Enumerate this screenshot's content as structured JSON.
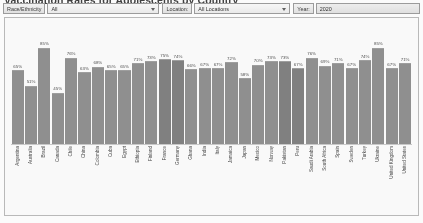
{
  "header": {
    "title": "Vaccination Rates for Adolescents by Country"
  },
  "filters": {
    "race": {
      "label": "Race/Ethnicity",
      "value": "All"
    },
    "location": {
      "label": "Location:",
      "value": "All Locations"
    },
    "year": {
      "label": "Year:",
      "value": "2020"
    },
    "chevron_icon": "chevron-down-icon"
  },
  "chart_data": {
    "type": "bar",
    "title": "Vaccination Rates for Adolescents by Country",
    "xlabel": "",
    "ylabel": "",
    "ylim": [
      0,
      100
    ],
    "grid": false,
    "legend": "none",
    "value_suffix": "%",
    "categories": [
      "Argentina",
      "Australia",
      "Brazil",
      "Canada",
      "Chile",
      "China",
      "Colombia",
      "Cuba",
      "Egypt",
      "Ethiopia",
      "Finland",
      "France",
      "Germany",
      "Ghana",
      "India",
      "Italy",
      "Jamaica",
      "Japan",
      "Mexico",
      "Norway",
      "Pakistan",
      "Peru",
      "Saudi Arabia",
      "South Africa",
      "Spain",
      "Sweden",
      "Turkey",
      "Ukraine",
      "United Kingdom",
      "United States"
    ],
    "values": [
      65,
      51,
      85,
      45,
      76,
      63,
      68,
      65,
      65,
      71,
      73,
      75,
      74,
      66,
      67,
      67,
      72,
      58,
      70,
      73,
      73,
      67,
      76,
      69,
      71,
      67,
      74,
      85,
      67,
      71
    ],
    "labels": [
      "65%",
      "51%",
      "85%",
      "45%",
      "76%",
      "63%",
      "68%",
      "65%",
      "65%",
      "71%",
      "73%",
      "75%",
      "74%",
      "66%",
      "67%",
      "67%",
      "72%",
      "58%",
      "70%",
      "73%",
      "73%",
      "67%",
      "76%",
      "69%",
      "71%",
      "67%",
      "74%",
      "85%",
      "67%",
      "71%"
    ],
    "bar_color": "#8d8d8d",
    "accent_color": "#7d7d7d"
  }
}
